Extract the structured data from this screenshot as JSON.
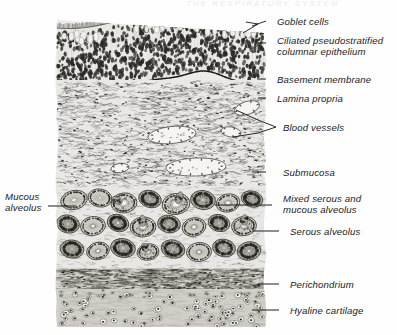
{
  "figure": {
    "title_fragment": "THE  RESPIRATORY  SYSTEM",
    "background_color": "#ffffff",
    "ink_color": "#1a1a1a"
  },
  "labels": [
    {
      "id": "goblet-cells",
      "text": "Goblet cells",
      "text2": "",
      "x": 277,
      "y": 16,
      "lead": {
        "x1": 266,
        "y1": 22,
        "x2": 250,
        "y2": 31
      }
    },
    {
      "id": "ciliated-epithelium",
      "text": "Ciliated pseudostratified",
      "text2": "columnar epithelium",
      "x": 277,
      "y": 35,
      "lead": {
        "x1": 266,
        "y1": 43,
        "x2": 259,
        "y2": 43
      }
    },
    {
      "id": "basement-membrane",
      "text": "Basement membrane",
      "text2": "",
      "x": 277,
      "y": 74,
      "lead": {
        "x1": 266,
        "y1": 79,
        "x2": 257,
        "y2": 79
      }
    },
    {
      "id": "lamina-propria",
      "text": "Lamina propria",
      "text2": "",
      "x": 277,
      "y": 93,
      "lead": {
        "x1": 266,
        "y1": 98,
        "x2": 258,
        "y2": 98
      }
    },
    {
      "id": "blood-vessels",
      "text": "Blood vessels",
      "text2": "",
      "x": 283,
      "y": 122,
      "lead": {
        "x1": 272,
        "y1": 127,
        "x2": 236,
        "y2": 127
      }
    },
    {
      "id": "submucosa",
      "text": "Submucosa",
      "text2": "",
      "x": 283,
      "y": 167,
      "lead": {
        "x1": 266,
        "y1": 172,
        "x2": 252,
        "y2": 172
      }
    },
    {
      "id": "mixed-alveolus",
      "text": "Mixed serous and",
      "text2": "mucous alveolus",
      "x": 283,
      "y": 193,
      "lead": {
        "x1": 272,
        "y1": 205,
        "x2": 215,
        "y2": 205
      }
    },
    {
      "id": "serous-alveolus",
      "text": "Serous alveolus",
      "text2": "",
      "x": 290,
      "y": 226,
      "lead": {
        "x1": 279,
        "y1": 231,
        "x2": 252,
        "y2": 231
      }
    },
    {
      "id": "perichondrium",
      "text": "Perichondrium",
      "text2": "",
      "x": 290,
      "y": 279,
      "lead": {
        "x1": 279,
        "y1": 284,
        "x2": 258,
        "y2": 284
      }
    },
    {
      "id": "hyaline-cartilage",
      "text": "Hyaline cartilage",
      "text2": "",
      "x": 290,
      "y": 305,
      "lead": {
        "x1": 279,
        "y1": 310,
        "x2": 252,
        "y2": 310
      }
    }
  ],
  "left_labels": [
    {
      "id": "mucous-alveolus",
      "text": "Mucous",
      "text2": "alveolus",
      "x": 5,
      "y": 191,
      "lead": {
        "x1": 48,
        "y1": 206,
        "x2": 76,
        "y2": 206
      }
    }
  ],
  "layers": [
    {
      "id": "epithelium",
      "name": "Ciliated pseudostratified columnar epithelium",
      "top": 18,
      "bottom": 80
    },
    {
      "id": "lamina",
      "name": "Lamina propria",
      "top": 80,
      "bottom": 140
    },
    {
      "id": "submucosa",
      "name": "Submucosa",
      "top": 140,
      "bottom": 185
    },
    {
      "id": "glands",
      "name": "Seromucous glands / alveoli",
      "top": 185,
      "bottom": 270
    },
    {
      "id": "perichondrium",
      "name": "Perichondrium",
      "top": 270,
      "bottom": 290
    },
    {
      "id": "cartilage",
      "name": "Hyaline cartilage",
      "top": 290,
      "bottom": 327
    }
  ],
  "bounds": {
    "left": 57,
    "right": 265,
    "top": 16,
    "bottom": 327
  }
}
